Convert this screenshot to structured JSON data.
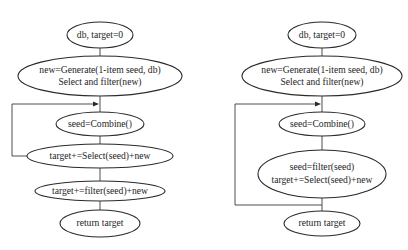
{
  "diagrams": [
    {
      "name": "flowchart-left",
      "nodes": [
        {
          "id": "start",
          "lines": [
            "db, target=0"
          ]
        },
        {
          "id": "generate",
          "lines": [
            "new=Generate(1-item seed, db)",
            "Select and filter(new)"
          ]
        },
        {
          "id": "combine",
          "lines": [
            "seed=Combine()"
          ]
        },
        {
          "id": "select",
          "lines": [
            "target+=Select(seed)+new"
          ]
        },
        {
          "id": "filter",
          "lines": [
            "target+=filter(seed)+new"
          ]
        },
        {
          "id": "return",
          "lines": [
            "return target"
          ]
        }
      ],
      "edges": [
        {
          "from": "start",
          "to": "generate"
        },
        {
          "from": "generate",
          "to": "combine"
        },
        {
          "from": "combine",
          "to": "select"
        },
        {
          "from": "select",
          "to": "combine",
          "type": "loop-back"
        },
        {
          "from": "select",
          "to": "filter"
        },
        {
          "from": "filter",
          "to": "return"
        }
      ]
    },
    {
      "name": "flowchart-right",
      "nodes": [
        {
          "id": "start",
          "lines": [
            "db, target=0"
          ]
        },
        {
          "id": "generate",
          "lines": [
            "new=Generate(1-item seed, db)",
            "Select and filter(new)"
          ]
        },
        {
          "id": "combine",
          "lines": [
            "seed=Combine()"
          ]
        },
        {
          "id": "filter-select",
          "lines": [
            "seed=filter(seed)",
            "target+=Select(seed)+new"
          ]
        },
        {
          "id": "return",
          "lines": [
            "return target"
          ]
        }
      ],
      "edges": [
        {
          "from": "start",
          "to": "generate"
        },
        {
          "from": "generate",
          "to": "combine"
        },
        {
          "from": "combine",
          "to": "filter-select"
        },
        {
          "from": "filter-select",
          "to": "combine",
          "type": "loop-back"
        },
        {
          "from": "filter-select",
          "to": "return"
        }
      ]
    }
  ],
  "colors": {
    "stroke": "#2a2a2a",
    "text": "#1e1e1e",
    "background": "#ffffff"
  }
}
